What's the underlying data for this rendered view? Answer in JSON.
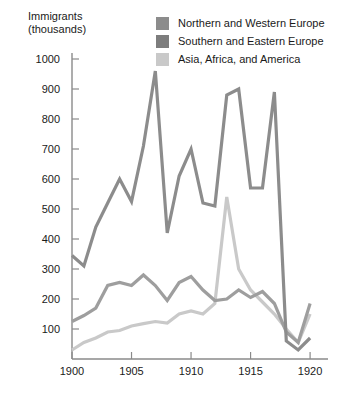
{
  "chart_data": {
    "type": "line",
    "title": "",
    "ylabel_line1": "Immigrants",
    "ylabel_line2": "(thousands)",
    "xlabel": "",
    "xlim": [
      1900,
      1921
    ],
    "ylim": [
      0,
      1050
    ],
    "grid": false,
    "legend_position": "top-right",
    "x": [
      1900,
      1901,
      1902,
      1903,
      1904,
      1905,
      1906,
      1907,
      1908,
      1909,
      1910,
      1911,
      1912,
      1913,
      1914,
      1915,
      1916,
      1917,
      1918,
      1919,
      1920
    ],
    "xticks": [
      1900,
      1905,
      1910,
      1915,
      1920
    ],
    "xtick_labels": [
      "1900",
      "1905",
      "1910",
      "1915",
      "1920"
    ],
    "yticks": [
      100,
      200,
      300,
      400,
      500,
      600,
      700,
      800,
      900,
      1000
    ],
    "ytick_labels": [
      "100",
      "200",
      "300",
      "400",
      "500",
      "600",
      "700",
      "800",
      "900",
      "1000"
    ],
    "series": [
      {
        "name": "Southern and Eastern Europe",
        "color": "#8c8c8c",
        "values": [
          345,
          310,
          440,
          520,
          600,
          525,
          710,
          960,
          420,
          610,
          700,
          520,
          510,
          880,
          900,
          570,
          570,
          890,
          60,
          30,
          70
        ]
      },
      {
        "name": "Northern and Western Europe",
        "color": "#9e9e9e",
        "values": [
          125,
          145,
          170,
          245,
          255,
          245,
          280,
          245,
          195,
          255,
          275,
          230,
          195,
          200,
          230,
          205,
          225,
          185,
          90,
          55,
          185
        ]
      },
      {
        "name": "Asia, Africa, and America",
        "color": "#c9c9c9",
        "values": [
          30,
          55,
          70,
          90,
          95,
          110,
          118,
          125,
          120,
          150,
          160,
          150,
          185,
          540,
          300,
          230,
          190,
          150,
          100,
          55,
          150
        ]
      }
    ],
    "legend": [
      {
        "label": "Northern and Western Europe",
        "color": "#8c8c8c"
      },
      {
        "label": "Southern and Eastern Europe",
        "color": "#7d7d7d"
      },
      {
        "label": "Asia, Africa, and America",
        "color": "#c9c9c9"
      }
    ]
  }
}
